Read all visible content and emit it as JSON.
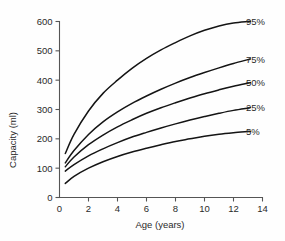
{
  "chart_data": {
    "type": "line",
    "title": "",
    "xlabel": "Age (years)",
    "ylabel": "Capacity (ml)",
    "xlim": [
      0,
      14
    ],
    "ylim": [
      0,
      600
    ],
    "xticks": [
      0,
      2,
      4,
      6,
      8,
      10,
      12,
      14
    ],
    "yticks": [
      0,
      100,
      200,
      300,
      400,
      500,
      600
    ],
    "xtick_labels": [
      "0",
      "2",
      "4",
      "6",
      "8",
      "10",
      "12",
      "14"
    ],
    "ytick_labels": [
      "0",
      "100",
      "200",
      "300",
      "400",
      "500",
      "600"
    ],
    "grid": false,
    "legend_position": "right-inline-labels",
    "x": [
      0.4,
      1,
      2,
      3,
      4,
      5,
      6,
      7,
      8,
      9,
      10,
      11,
      12,
      13
    ],
    "series": [
      {
        "name": "95%",
        "label": "95%",
        "color": "#141414",
        "values": [
          150,
          215,
          295,
          355,
          400,
          440,
          474,
          503,
          528,
          551,
          570,
          585,
          595,
          600
        ]
      },
      {
        "name": "75%",
        "label": "75%",
        "color": "#141414",
        "values": [
          118,
          160,
          215,
          258,
          292,
          321,
          346,
          369,
          390,
          409,
          426,
          442,
          457,
          470
        ]
      },
      {
        "name": "50%",
        "label": "50%",
        "color": "#141414",
        "values": [
          105,
          138,
          180,
          213,
          241,
          265,
          287,
          306,
          323,
          339,
          354,
          367,
          379,
          390
        ]
      },
      {
        "name": "25%",
        "label": "25%",
        "color": "#141414",
        "values": [
          90,
          112,
          142,
          166,
          187,
          206,
          222,
          237,
          251,
          264,
          276,
          287,
          297,
          305
        ]
      },
      {
        "name": "5%",
        "label": "5%",
        "color": "#141414",
        "values": [
          48,
          72,
          100,
          122,
          140,
          155,
          168,
          180,
          191,
          200,
          209,
          216,
          221,
          225
        ]
      }
    ]
  },
  "axes": {
    "y_title": "Capacity (ml)",
    "x_title": "Age (years)"
  }
}
